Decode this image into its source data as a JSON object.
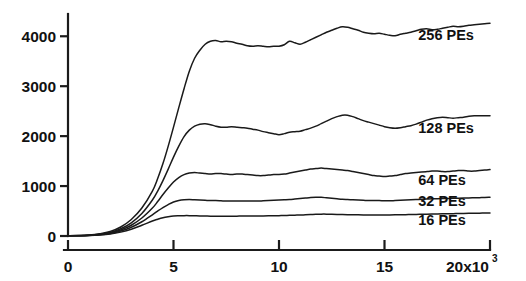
{
  "chart_data": {
    "type": "line",
    "title": "",
    "subtitle": "",
    "xlabel": "",
    "ylabel": "",
    "xlim": [
      0,
      20
    ],
    "ylim": [
      0,
      4500
    ],
    "grid": false,
    "legend_position": "inline-right",
    "x_tick_labels": [
      "0",
      "5",
      "10",
      "15",
      "20x10"
    ],
    "x_tick_values": [
      0,
      5,
      10,
      15,
      20
    ],
    "x_axis_exponent": "3",
    "y_tick_labels": [
      "0",
      "1000",
      "2000",
      "3000",
      "4000"
    ],
    "y_tick_values": [
      0,
      1000,
      2000,
      3000,
      4000
    ],
    "x": [
      0,
      0.5,
      1,
      1.5,
      2,
      2.5,
      3,
      3.5,
      4,
      4.25,
      4.5,
      4.75,
      5,
      5.25,
      5.5,
      5.75,
      6,
      6.25,
      6.5,
      6.75,
      7,
      7.25,
      7.5,
      7.75,
      8,
      8.25,
      8.5,
      8.75,
      9,
      9.25,
      9.5,
      9.75,
      10,
      10.25,
      10.5,
      10.75,
      11,
      11.25,
      11.5,
      11.75,
      12,
      12.25,
      12.5,
      12.75,
      13,
      13.25,
      13.5,
      13.75,
      14,
      14.25,
      14.5,
      14.75,
      15,
      15.25,
      15.5,
      15.75,
      16,
      16.25,
      16.5,
      16.75,
      17,
      17.25,
      17.5,
      17.75,
      18,
      18.25,
      18.5,
      18.75,
      19,
      19.25,
      19.5,
      19.75,
      20
    ],
    "series": [
      {
        "name": "256 PEs",
        "label": "256 PEs",
        "label_x": 16.6,
        "label_y": 3930,
        "color": "#1a1a1a",
        "values": [
          5,
          10,
          20,
          45,
          90,
          180,
          330,
          560,
          900,
          1150,
          1450,
          1800,
          2180,
          2570,
          2950,
          3300,
          3560,
          3720,
          3840,
          3900,
          3915,
          3890,
          3900,
          3890,
          3860,
          3840,
          3810,
          3800,
          3810,
          3800,
          3790,
          3800,
          3800,
          3830,
          3900,
          3870,
          3840,
          3880,
          3930,
          3980,
          4030,
          4080,
          4120,
          4160,
          4190,
          4180,
          4150,
          4120,
          4080,
          4060,
          4050,
          4060,
          4040,
          4020,
          4010,
          4040,
          4060,
          4080,
          4110,
          4140,
          4150,
          4130,
          4140,
          4160,
          4180,
          4200,
          4190,
          4200,
          4220,
          4230,
          4240,
          4250,
          4260
        ]
      },
      {
        "name": "128 PEs",
        "label": "128 PEs",
        "label_x": 16.6,
        "label_y": 2060,
        "color": "#1a1a1a",
        "values": [
          5,
          8,
          16,
          36,
          72,
          145,
          265,
          450,
          720,
          900,
          1110,
          1340,
          1580,
          1800,
          1990,
          2120,
          2200,
          2240,
          2250,
          2230,
          2200,
          2180,
          2180,
          2190,
          2180,
          2170,
          2160,
          2140,
          2120,
          2090,
          2070,
          2050,
          2030,
          2050,
          2080,
          2090,
          2100,
          2130,
          2160,
          2200,
          2250,
          2300,
          2350,
          2390,
          2420,
          2420,
          2390,
          2350,
          2310,
          2280,
          2250,
          2220,
          2190,
          2170,
          2160,
          2170,
          2190,
          2210,
          2240,
          2280,
          2320,
          2350,
          2370,
          2380,
          2370,
          2360,
          2370,
          2380,
          2400,
          2410,
          2410,
          2410,
          2410
        ]
      },
      {
        "name": "64 PEs",
        "label": "64 PEs",
        "label_x": 16.6,
        "label_y": 1030,
        "color": "#1a1a1a",
        "values": [
          4,
          7,
          14,
          30,
          60,
          120,
          215,
          360,
          560,
          690,
          830,
          960,
          1080,
          1170,
          1230,
          1260,
          1270,
          1260,
          1250,
          1240,
          1250,
          1250,
          1240,
          1230,
          1240,
          1240,
          1230,
          1220,
          1210,
          1210,
          1220,
          1230,
          1230,
          1240,
          1260,
          1280,
          1300,
          1320,
          1340,
          1350,
          1360,
          1350,
          1340,
          1330,
          1320,
          1310,
          1290,
          1270,
          1250,
          1230,
          1210,
          1200,
          1190,
          1200,
          1210,
          1230,
          1250,
          1260,
          1270,
          1280,
          1290,
          1300,
          1300,
          1290,
          1290,
          1300,
          1310,
          1310,
          1300,
          1300,
          1310,
          1320,
          1330
        ]
      },
      {
        "name": "32 PEs",
        "label": "32 PEs",
        "label_x": 16.6,
        "label_y": 600,
        "color": "#1a1a1a",
        "values": [
          3,
          6,
          12,
          25,
          50,
          100,
          175,
          285,
          425,
          500,
          570,
          630,
          680,
          710,
          725,
          730,
          725,
          720,
          715,
          710,
          710,
          705,
          700,
          700,
          700,
          700,
          700,
          700,
          700,
          705,
          710,
          715,
          720,
          725,
          730,
          740,
          750,
          760,
          770,
          775,
          775,
          765,
          755,
          745,
          735,
          730,
          725,
          720,
          715,
          710,
          710,
          710,
          705,
          705,
          710,
          715,
          720,
          725,
          730,
          735,
          740,
          745,
          748,
          750,
          752,
          755,
          758,
          760,
          762,
          765,
          768,
          770,
          775
        ]
      },
      {
        "name": "16 PEs",
        "label": "16 PEs",
        "label_x": 16.6,
        "label_y": 215,
        "color": "#1a1a1a",
        "values": [
          2,
          5,
          10,
          20,
          40,
          78,
          135,
          215,
          300,
          335,
          365,
          385,
          400,
          405,
          408,
          408,
          405,
          402,
          400,
          398,
          398,
          398,
          398,
          398,
          398,
          400,
          400,
          400,
          400,
          402,
          404,
          406,
          408,
          410,
          415,
          418,
          420,
          425,
          430,
          435,
          438,
          438,
          435,
          432,
          430,
          428,
          426,
          424,
          422,
          420,
          420,
          420,
          420,
          422,
          424,
          426,
          428,
          430,
          432,
          435,
          438,
          440,
          442,
          444,
          446,
          448,
          450,
          452,
          454,
          456,
          458,
          460,
          462
        ]
      }
    ]
  }
}
